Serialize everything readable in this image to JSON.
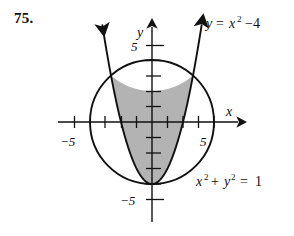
{
  "problem": {
    "number": "75."
  },
  "figure": {
    "axes": {
      "x_axis_label": "x",
      "y_axis_label": "y",
      "x_tick_labels": [
        {
          "value": -5,
          "text": "−5"
        },
        {
          "value": 5,
          "text": "5"
        }
      ],
      "y_tick_labels": [
        {
          "value": 5,
          "text": "5"
        },
        {
          "value": -5,
          "text": "−5"
        }
      ],
      "x_range": [
        -6.2,
        5.8
      ],
      "y_range": [
        -6.5,
        6.6
      ],
      "tick_values": [
        -5,
        -4,
        -3,
        -2,
        -1,
        1,
        2,
        3,
        4,
        5
      ],
      "grid": false
    },
    "curve_labels": {
      "parabola": {
        "lhs": "y",
        "equals": "=",
        "base": "x",
        "exponent": "2",
        "tail": "−4",
        "full": "y = x² −4"
      },
      "circle": {
        "term1_base": "x",
        "term1_exp": "2",
        "plus": "+",
        "term2_base": "y",
        "term2_exp": "2",
        "equals": "=",
        "rhs": "1",
        "full": "x² + y² = 1"
      }
    },
    "colors": {
      "shaded_region": "#b3b3b3",
      "curve_stroke": "#111111",
      "axis_stroke": "#111111",
      "background": "#ffffff"
    }
  },
  "chart_data": {
    "type": "line",
    "title": "",
    "xlabel": "x",
    "ylabel": "y",
    "xlim": [
      -6.2,
      5.8
    ],
    "ylim": [
      -6.5,
      6.6
    ],
    "grid": false,
    "xticks": [
      -5,
      -4,
      -3,
      -2,
      -1,
      1,
      2,
      3,
      4,
      5
    ],
    "xticklabels": [
      "−5",
      "",
      "",
      "",
      "",
      "",
      "",
      "",
      "",
      "5"
    ],
    "yticks": [
      -5,
      -4,
      -3,
      -2,
      -1,
      1,
      2,
      3,
      4,
      5
    ],
    "yticklabels": [
      "−5",
      "",
      "",
      "",
      "",
      "",
      "",
      "",
      "",
      "5"
    ],
    "series": [
      {
        "name": "y = x² −4",
        "type": "parabola",
        "equation": "y = x^2 - 4",
        "vertex": [
          0,
          -4
        ],
        "a": 1,
        "h": 0,
        "k": -4,
        "x_domain": [
          -3.2,
          3.2
        ],
        "arrowheads": [
          "left-end",
          "right-end"
        ],
        "label": "y = x² −4"
      },
      {
        "name": "x² + y² = 1",
        "type": "circle",
        "equation": "x^2 + y^2 = 16",
        "center": [
          0,
          0
        ],
        "radius": 4,
        "label": "x² + y² = 1"
      }
    ],
    "shaded_region": {
      "description": "Region inside the circle and above the parabola",
      "fill": "#b3b3b3",
      "constraints": [
        "x^2 + y^2 <= 16",
        "y >= x^2 - 4"
      ],
      "intersections": [
        [
          -2.562,
          2.562
        ],
        [
          2.562,
          2.562
        ],
        [
          0,
          -4
        ]
      ]
    },
    "annotations": [
      {
        "text": "y = x² −4",
        "x": 2.9,
        "y": 6.0
      },
      {
        "text": "x² + y² = 1",
        "x": 2.4,
        "y": -3.4
      }
    ]
  }
}
